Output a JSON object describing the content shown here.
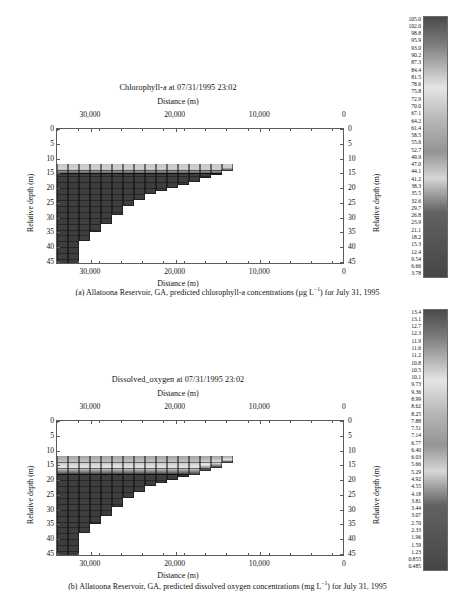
{
  "figure": {
    "panels": [
      {
        "id": "a",
        "chart_title": "Chlorophyll-a at 07/31/1995 23:02",
        "x_axis_title_top": "Distance (m)",
        "x_axis_title_bottom": "Distance (m)",
        "y_axis_title_left": "Relative depth (m)",
        "y_axis_title_right": "Relative depth (m)",
        "x_ticks": [
          "30,000",
          "20,000",
          "10,000",
          "0"
        ],
        "y_ticks": [
          "0",
          "5",
          "10",
          "15",
          "20",
          "25",
          "30",
          "35",
          "40",
          "45"
        ],
        "caption_prefix": "(a)",
        "caption_text": "Allatoona Reservoir, GA, predicted chlorophyll-a concentrations (µg L",
        "caption_exponent": "−1",
        "caption_suffix": ") for July 31, 1995",
        "colorbar_labels": [
          "105.0",
          "102.0",
          "98.8",
          "95.9",
          "93.0",
          "90.2",
          "87.3",
          "84.4",
          "81.5",
          "78.6",
          "75.8",
          "72.9",
          "70.0",
          "67.1",
          "64.2",
          "61.4",
          "58.5",
          "55.6",
          "52.7",
          "49.9",
          "47.0",
          "44.1",
          "41.2",
          "38.3",
          "35.5",
          "32.6",
          "29.7",
          "26.8",
          "23.9",
          "21.1",
          "18.2",
          "15.3",
          "12.4",
          "9.54",
          "6.66",
          "3.78"
        ]
      },
      {
        "id": "b",
        "chart_title": "Dissolved_oxygen at 07/31/1995 23:02",
        "x_axis_title_top": "Distance (m)",
        "x_axis_title_bottom": "Distance (m)",
        "y_axis_title_left": "Relative depth (m)",
        "y_axis_title_right": "Relative depth (m)",
        "x_ticks": [
          "30,000",
          "20,000",
          "10,000",
          "0"
        ],
        "y_ticks": [
          "0",
          "5",
          "10",
          "15",
          "20",
          "25",
          "30",
          "35",
          "40",
          "45"
        ],
        "caption_prefix": "(b)",
        "caption_text": "Allatoona Reservoir, GA, predicted dissolved oxygen concentrations (mg L",
        "caption_exponent": "−1",
        "caption_suffix": ") for July 31, 1995",
        "colorbar_labels": [
          "13.4",
          "13.1",
          "12.7",
          "12.3",
          "11.9",
          "11.6",
          "11.2",
          "10.8",
          "10.5",
          "10.1",
          "9.73",
          "9.36",
          "8.99",
          "8.62",
          "8.25",
          "7.88",
          "7.51",
          "7.14",
          "6.77",
          "6.40",
          "6.03",
          "5.66",
          "5.29",
          "4.92",
          "4.55",
          "4.18",
          "3.81",
          "3.44",
          "3.07",
          "2.70",
          "2.33",
          "1.96",
          "1.59",
          "1.23",
          "0.855",
          "0.485"
        ]
      }
    ]
  },
  "chart_data": [
    {
      "type": "heatmap",
      "panel": "a",
      "title": "Chlorophyll-a at 07/31/1995 23:02",
      "xlabel": "Distance (m)",
      "ylabel": "Relative depth (m)",
      "xlim": [
        34000,
        0
      ],
      "ylim": [
        46,
        0
      ],
      "x_reversed": true,
      "y_reversed": true,
      "grid": true,
      "legend": "colorbar-right",
      "units": "µg L−1",
      "colormap": "grayscale",
      "zlim": [
        3.78,
        105.0
      ],
      "xticks": [
        30000,
        20000,
        10000,
        0
      ],
      "xticklabels": [
        "30,000",
        "20,000",
        "10,000",
        "0"
      ],
      "yticks": [
        0,
        5,
        10,
        15,
        20,
        25,
        30,
        35,
        40,
        45
      ],
      "yticklabels": [
        "0",
        "5",
        "10",
        "15",
        "20",
        "25",
        "30",
        "35",
        "40",
        "45"
      ],
      "colorbar_ticks": [
        105.0,
        102.0,
        98.8,
        95.9,
        93.0,
        90.2,
        87.3,
        84.4,
        81.5,
        78.6,
        75.8,
        72.9,
        70.0,
        67.1,
        64.2,
        61.4,
        58.5,
        55.6,
        52.7,
        49.9,
        47.0,
        44.1,
        41.2,
        38.3,
        35.5,
        32.6,
        29.7,
        26.8,
        23.9,
        21.1,
        18.2,
        15.3,
        12.4,
        9.54,
        6.66,
        3.78
      ],
      "description": "Longitudinal reservoir cross-section; water body occupies a wedge deepest at the dam (left, 46 m) thinning upstream to the right, surface water begins near 12 m relative depth. A bright (high-concentration) surface layer sits between about 12 and 15 m depth; deeper water is uniformly dark (low concentration).",
      "segments": [
        {
          "x_left": 34000,
          "x_right": 32700,
          "top_depth": 12.0,
          "bottom_depth": 46.0
        },
        {
          "x_left": 32700,
          "x_right": 31400,
          "top_depth": 12.0,
          "bottom_depth": 46.0
        },
        {
          "x_left": 31400,
          "x_right": 30100,
          "top_depth": 12.0,
          "bottom_depth": 38.0
        },
        {
          "x_left": 30100,
          "x_right": 28800,
          "top_depth": 12.0,
          "bottom_depth": 35.0
        },
        {
          "x_left": 28800,
          "x_right": 27500,
          "top_depth": 12.0,
          "bottom_depth": 32.0
        },
        {
          "x_left": 27500,
          "x_right": 26200,
          "top_depth": 12.0,
          "bottom_depth": 29.0
        },
        {
          "x_left": 26200,
          "x_right": 24900,
          "top_depth": 12.0,
          "bottom_depth": 26.0
        },
        {
          "x_left": 24900,
          "x_right": 23600,
          "top_depth": 12.0,
          "bottom_depth": 24.0
        },
        {
          "x_left": 23600,
          "x_right": 22300,
          "top_depth": 12.0,
          "bottom_depth": 22.0
        },
        {
          "x_left": 22300,
          "x_right": 21000,
          "top_depth": 12.0,
          "bottom_depth": 21.0
        },
        {
          "x_left": 21000,
          "x_right": 19700,
          "top_depth": 12.0,
          "bottom_depth": 20.0
        },
        {
          "x_left": 19700,
          "x_right": 18400,
          "top_depth": 12.0,
          "bottom_depth": 19.0
        },
        {
          "x_left": 18400,
          "x_right": 17100,
          "top_depth": 12.0,
          "bottom_depth": 18.0
        },
        {
          "x_left": 17100,
          "x_right": 15800,
          "top_depth": 12.0,
          "bottom_depth": 16.5
        },
        {
          "x_left": 15800,
          "x_right": 14500,
          "top_depth": 12.0,
          "bottom_depth": 15.5
        },
        {
          "x_left": 14500,
          "x_right": 13200,
          "top_depth": 12.0,
          "bottom_depth": 14.0
        }
      ],
      "surface_layer": {
        "top_depth": 12.0,
        "bottom_depth": 15.0,
        "relative_value": "high"
      }
    },
    {
      "type": "heatmap",
      "panel": "b",
      "title": "Dissolved_oxygen at 07/31/1995 23:02",
      "xlabel": "Distance (m)",
      "ylabel": "Relative depth (m)",
      "xlim": [
        34000,
        0
      ],
      "ylim": [
        46,
        0
      ],
      "x_reversed": true,
      "y_reversed": true,
      "grid": true,
      "legend": "colorbar-right",
      "units": "mg L−1",
      "colormap": "grayscale",
      "zlim": [
        0.485,
        13.4
      ],
      "xticks": [
        30000,
        20000,
        10000,
        0
      ],
      "xticklabels": [
        "30,000",
        "20,000",
        "10,000",
        "0"
      ],
      "yticks": [
        0,
        5,
        10,
        15,
        20,
        25,
        30,
        35,
        40,
        45
      ],
      "yticklabels": [
        "0",
        "5",
        "10",
        "15",
        "20",
        "25",
        "30",
        "35",
        "40",
        "45"
      ],
      "colorbar_ticks": [
        13.4,
        13.1,
        12.7,
        12.3,
        11.9,
        11.6,
        11.2,
        10.8,
        10.5,
        10.1,
        9.73,
        9.36,
        8.99,
        8.62,
        8.25,
        7.88,
        7.51,
        7.14,
        6.77,
        6.4,
        6.03,
        5.66,
        5.29,
        4.92,
        4.55,
        4.18,
        3.81,
        3.44,
        3.07,
        2.7,
        2.33,
        1.96,
        1.59,
        1.23,
        0.855,
        0.485
      ],
      "description": "Same reservoir wedge. A bright oxygenated epilimnion spans roughly 12 to 17 m relative depth across the whole reservoir, with the brightest band near 15 to 17 m; below the thermocline the hypolimnion is dark, indicating near-anoxic conditions down to the 46 m bottom at the dam.",
      "segments": [
        {
          "x_left": 34000,
          "x_right": 32700,
          "top_depth": 12.0,
          "bottom_depth": 46.0
        },
        {
          "x_left": 32700,
          "x_right": 31400,
          "top_depth": 12.0,
          "bottom_depth": 46.0
        },
        {
          "x_left": 31400,
          "x_right": 30100,
          "top_depth": 12.0,
          "bottom_depth": 38.0
        },
        {
          "x_left": 30100,
          "x_right": 28800,
          "top_depth": 12.0,
          "bottom_depth": 35.0
        },
        {
          "x_left": 28800,
          "x_right": 27500,
          "top_depth": 12.0,
          "bottom_depth": 32.0
        },
        {
          "x_left": 27500,
          "x_right": 26200,
          "top_depth": 12.0,
          "bottom_depth": 29.0
        },
        {
          "x_left": 26200,
          "x_right": 24900,
          "top_depth": 12.0,
          "bottom_depth": 26.0
        },
        {
          "x_left": 24900,
          "x_right": 23600,
          "top_depth": 12.0,
          "bottom_depth": 24.0
        },
        {
          "x_left": 23600,
          "x_right": 22300,
          "top_depth": 12.0,
          "bottom_depth": 22.0
        },
        {
          "x_left": 22300,
          "x_right": 21000,
          "top_depth": 12.0,
          "bottom_depth": 21.0
        },
        {
          "x_left": 21000,
          "x_right": 19700,
          "top_depth": 12.0,
          "bottom_depth": 20.0
        },
        {
          "x_left": 19700,
          "x_right": 18400,
          "top_depth": 12.0,
          "bottom_depth": 19.0
        },
        {
          "x_left": 18400,
          "x_right": 17100,
          "top_depth": 12.0,
          "bottom_depth": 18.0
        },
        {
          "x_left": 17100,
          "x_right": 15800,
          "top_depth": 12.0,
          "bottom_depth": 16.5
        },
        {
          "x_left": 15800,
          "x_right": 14500,
          "top_depth": 12.0,
          "bottom_depth": 15.5
        },
        {
          "x_left": 14500,
          "x_right": 13200,
          "top_depth": 12.0,
          "bottom_depth": 14.0
        }
      ],
      "surface_layer": {
        "top_depth": 12.0,
        "bottom_depth": 18.0,
        "relative_value": "high"
      }
    }
  ]
}
